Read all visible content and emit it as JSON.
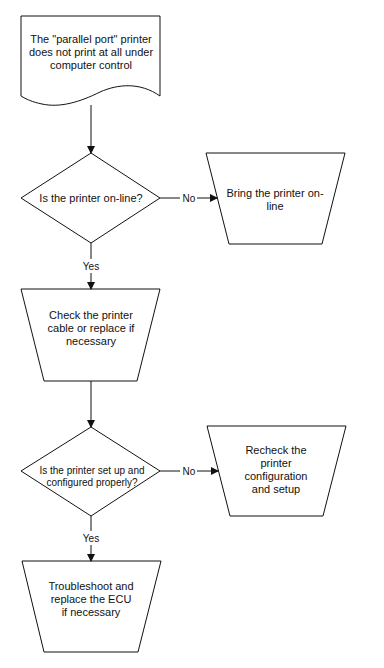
{
  "flowchart": {
    "start": {
      "text": "The \"parallel port\" printer does not print at all under computer control"
    },
    "decision1": {
      "text": "Is the printer on-line?"
    },
    "decision1_no_action": {
      "text": "Bring the printer on-line"
    },
    "decision1_no_label": "No",
    "decision1_yes_label": "Yes",
    "step_check_cable": {
      "text": "Check the printer cable or replace if necessary"
    },
    "decision2": {
      "text": "Is the printer set up and configured properly?"
    },
    "decision2_no_action": {
      "text": "Recheck the printer configuration and setup"
    },
    "decision2_no_label": "No",
    "decision2_yes_label": "Yes",
    "final_step": {
      "text": "Troubleshoot and replace the ECU if necessary"
    }
  },
  "colors": {
    "stroke": "#111111",
    "background": "#ffffff"
  }
}
